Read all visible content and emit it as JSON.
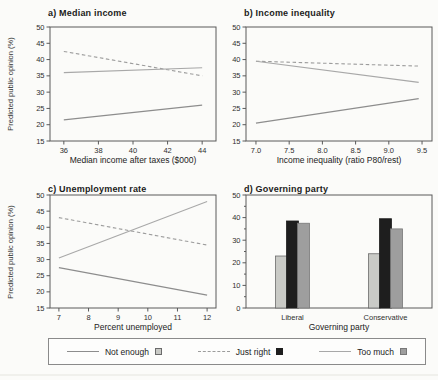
{
  "chart_data": [
    {
      "id": "a",
      "type": "line",
      "title": "a) Median income",
      "xlabel": "Median income after taxes ($000)",
      "ylabel": "Predicted public opinion (%)",
      "xlim": [
        35.2,
        44.8
      ],
      "ylim": [
        15,
        50
      ],
      "xticks": [
        36,
        38,
        40,
        42,
        44
      ],
      "xtick_labels": [
        "36",
        "38",
        "40",
        "42",
        "44"
      ],
      "yticks": [
        15,
        20,
        25,
        30,
        35,
        40,
        45,
        50
      ],
      "ytick_labels": [
        "15",
        "20",
        "25",
        "30",
        "35",
        "40",
        "45",
        "50"
      ],
      "series": [
        {
          "name": "Not enough",
          "style": "solid",
          "color": "#8d8d8d",
          "x": [
            36,
            44
          ],
          "y": [
            21.5,
            26
          ]
        },
        {
          "name": "Just right",
          "style": "dashed",
          "color": "#9c9c9c",
          "x": [
            36,
            44
          ],
          "y": [
            42.5,
            35
          ]
        },
        {
          "name": "Too much",
          "style": "solid",
          "color": "#a8a8a8",
          "x": [
            36,
            44
          ],
          "y": [
            36,
            37.5
          ]
        }
      ]
    },
    {
      "id": "b",
      "type": "line",
      "title": "b) Income inequality",
      "xlabel": "Income inequality (ratio P80/rest)",
      "ylabel": "",
      "xlim": [
        6.85,
        9.65
      ],
      "ylim": [
        15,
        50
      ],
      "xticks": [
        7.0,
        7.5,
        8.0,
        8.5,
        9.0,
        9.5
      ],
      "xtick_labels": [
        "7.0",
        "7.5",
        "8.0",
        "8.5",
        "9.0",
        "9.5"
      ],
      "yticks": [
        15,
        20,
        25,
        30,
        35,
        40,
        45,
        50
      ],
      "ytick_labels": [
        "15",
        "20",
        "25",
        "30",
        "35",
        "40",
        "45",
        "50"
      ],
      "series": [
        {
          "name": "Not enough",
          "style": "solid",
          "color": "#8d8d8d",
          "x": [
            7.0,
            9.45
          ],
          "y": [
            20.5,
            28
          ]
        },
        {
          "name": "Just right",
          "style": "dashed",
          "color": "#9c9c9c",
          "x": [
            7.0,
            9.45
          ],
          "y": [
            39.5,
            38
          ]
        },
        {
          "name": "Too much",
          "style": "solid",
          "color": "#a8a8a8",
          "x": [
            7.0,
            9.45
          ],
          "y": [
            39.5,
            33
          ]
        }
      ]
    },
    {
      "id": "c",
      "type": "line",
      "title": "c) Unemployment rate",
      "xlabel": "Percent unemployed",
      "ylabel": "Predicted public opinion (%)",
      "xlim": [
        6.7,
        12.3
      ],
      "ylim": [
        15,
        50
      ],
      "xticks": [
        7,
        8,
        9,
        10,
        11,
        12
      ],
      "xtick_labels": [
        "7",
        "8",
        "9",
        "10",
        "11",
        "12"
      ],
      "yticks": [
        15,
        20,
        25,
        30,
        35,
        40,
        45,
        50
      ],
      "ytick_labels": [
        "15",
        "20",
        "25",
        "30",
        "35",
        "40",
        "45",
        "50"
      ],
      "series": [
        {
          "name": "Not enough",
          "style": "solid",
          "color": "#8d8d8d",
          "x": [
            7,
            12
          ],
          "y": [
            27.5,
            19
          ]
        },
        {
          "name": "Just right",
          "style": "dashed",
          "color": "#9c9c9c",
          "x": [
            7,
            12
          ],
          "y": [
            43,
            34.5
          ]
        },
        {
          "name": "Too much",
          "style": "solid",
          "color": "#a8a8a8",
          "x": [
            7,
            12
          ],
          "y": [
            30.5,
            48
          ]
        }
      ]
    },
    {
      "id": "d",
      "type": "bar",
      "title": "d) Governing party",
      "xlabel": "Governing party",
      "ylabel": "",
      "ylim": [
        0,
        50
      ],
      "yticks": [
        0,
        10,
        20,
        30,
        40,
        50
      ],
      "ytick_labels": [
        "0",
        "10",
        "20",
        "30",
        "40",
        "50"
      ],
      "yticks_minor": [
        5,
        15,
        25,
        35,
        45
      ],
      "categories": [
        "Liberal",
        "Conservative"
      ],
      "series": [
        {
          "name": "Not enough",
          "color": "#c9cac6",
          "edge": "#6b6b6b",
          "values": [
            23,
            24
          ]
        },
        {
          "name": "Just right",
          "color": "#1e1e1e",
          "edge": "#1e1e1e",
          "values": [
            38.5,
            39.5
          ]
        },
        {
          "name": "Too much",
          "color": "#9e9e9e",
          "edge": "#787878",
          "values": [
            37.5,
            35
          ]
        }
      ]
    }
  ],
  "legend": {
    "items": [
      {
        "label": "Not enough",
        "line_style": "solid",
        "line_color": "#8d8d8d",
        "swatch_color": "#c9cac6",
        "swatch_border": "#6b6b6b"
      },
      {
        "label": "Just right",
        "line_style": "dashed",
        "line_color": "#9c9c9c",
        "swatch_color": "#1e1e1e",
        "swatch_border": "#1e1e1e"
      },
      {
        "label": "Too much",
        "line_style": "solid",
        "line_color": "#a8a8a8",
        "swatch_color": "#9e9e9e",
        "swatch_border": "#787878"
      }
    ]
  }
}
